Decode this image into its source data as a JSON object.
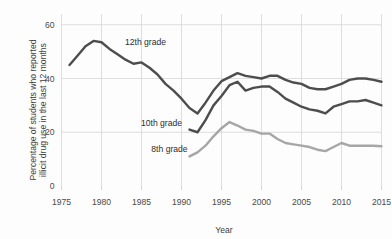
{
  "chart_data": {
    "type": "line",
    "title": "",
    "xlabel": "Year",
    "ylabel": "Percentage of students who reported illicit drug use in the last 12 months",
    "ylabel_line1": "Percentage of students who reported",
    "ylabel_line2": "illicit drug use in the last 12 months",
    "xlim": [
      1975,
      2015
    ],
    "ylim": [
      0,
      64
    ],
    "xticks": [
      1975,
      1980,
      1985,
      1990,
      1995,
      2000,
      2005,
      2010,
      2015
    ],
    "xtick_labels": [
      "1975",
      "1980",
      "1985",
      "1990",
      "1995",
      "2000",
      "2005",
      "2010",
      "2015"
    ],
    "yticks": [
      0,
      20,
      40,
      60
    ],
    "ytick_labels": [
      "0",
      "20",
      "40",
      "60"
    ],
    "grid": "both",
    "legend_position": "inline-annotations",
    "colors": {
      "grade12": "#4d4d4d",
      "grade10": "#4d4d4d",
      "grade8": "#a6a6a6",
      "gridline": "#d6d6d6",
      "text": "#4a4a4a",
      "background": "#fdfdfd"
    },
    "series": [
      {
        "name": "12th grade",
        "label": "12th grade",
        "color": "#4d4d4d",
        "x": [
          1976,
          1977,
          1978,
          1979,
          1980,
          1981,
          1982,
          1983,
          1984,
          1985,
          1986,
          1987,
          1988,
          1989,
          1990,
          1991,
          1992,
          1993,
          1994,
          1995,
          1996,
          1997,
          1998,
          1999,
          2000,
          2001,
          2002,
          2003,
          2004,
          2005,
          2006,
          2007,
          2008,
          2009,
          2010,
          2011,
          2012,
          2013,
          2014,
          2015
        ],
        "values": [
          45,
          48.5,
          52,
          54,
          53.5,
          51,
          49,
          47,
          45.5,
          46,
          44,
          41.5,
          38,
          35.5,
          32.5,
          29,
          27,
          31,
          35.5,
          39,
          40.5,
          42,
          41,
          40.5,
          40,
          41,
          41,
          39.5,
          38.5,
          38,
          36.5,
          36,
          36,
          37,
          38,
          39.5,
          40,
          40,
          39.5,
          38.8
        ]
      },
      {
        "name": "10th grade",
        "label": "10th grade",
        "color": "#4d4d4d",
        "x": [
          1991,
          1992,
          1993,
          1994,
          1995,
          1996,
          1997,
          1998,
          1999,
          2000,
          2001,
          2002,
          2003,
          2004,
          2005,
          2006,
          2007,
          2008,
          2009,
          2010,
          2011,
          2012,
          2013,
          2014,
          2015
        ],
        "values": [
          21,
          20,
          24.5,
          30,
          33.5,
          37.5,
          38.8,
          35.5,
          36.5,
          37,
          37,
          35,
          32.5,
          31,
          29.5,
          28.5,
          28,
          27,
          29.5,
          30.5,
          31.5,
          31.5,
          32,
          31,
          30
        ],
        "note": "series begins 1991"
      },
      {
        "name": "8th grade",
        "label": "8th grade",
        "color": "#a6a6a6",
        "x": [
          1991,
          1992,
          1993,
          1994,
          1995,
          1996,
          1997,
          1998,
          1999,
          2000,
          2001,
          2002,
          2003,
          2004,
          2005,
          2006,
          2007,
          2008,
          2009,
          2010,
          2011,
          2012,
          2013,
          2014,
          2015
        ],
        "values": [
          11,
          12.5,
          15,
          18.5,
          21.5,
          23.8,
          22.5,
          21,
          20.5,
          19.5,
          19.5,
          17.5,
          16,
          15.5,
          15,
          14.5,
          13.5,
          13,
          14.5,
          16,
          15,
          15,
          15,
          15,
          14.8
        ],
        "note": "series begins 1991"
      }
    ],
    "annotations": [
      {
        "text": "12th grade",
        "x_year": 1985.5,
        "y_value": 52.5
      },
      {
        "text": "10th grade",
        "x_year": 1987.5,
        "y_value": 22.5
      },
      {
        "text": "8th grade",
        "x_year": 1988.5,
        "y_value": 12.5
      }
    ]
  }
}
